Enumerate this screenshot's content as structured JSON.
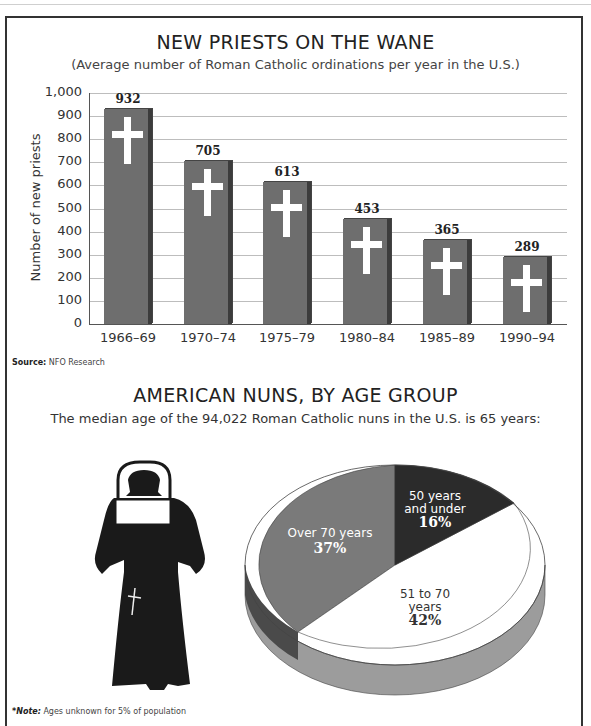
{
  "bar_chart": {
    "title": "NEW PRIESTS ON THE WANE",
    "subtitle": "(Average number of Roman Catholic ordinations per year in the U.S.)",
    "ylabel": "Number of new priests",
    "yticks": [
      "1,000",
      "900",
      "800",
      "700",
      "600",
      "500",
      "400",
      "300",
      "200",
      "100",
      "0"
    ],
    "categories": [
      "1966–69",
      "1970–74",
      "1975–79",
      "1980–84",
      "1985–89",
      "1990–94"
    ],
    "values": [
      "932",
      "705",
      "613",
      "453",
      "365",
      "289"
    ],
    "source_label": "Source:",
    "source_text": "NFO Research"
  },
  "pie_chart": {
    "title": "AMERICAN NUNS, BY AGE GROUP",
    "subtitle": "The median age of the 94,022 Roman Catholic nuns in the U.S. is 65 years:",
    "segments": [
      {
        "label_line1": "50 years",
        "label_line2": "and under",
        "pct": "16%"
      },
      {
        "label_line1": "51 to 70",
        "label_line2": "years",
        "pct": "42%"
      },
      {
        "label_line1": "Over 70 years",
        "label_line2": "",
        "pct": "37%"
      }
    ],
    "note_label": "*Note:",
    "note_text": "Ages unknown for 5% of population"
  },
  "colors": {
    "bar": "#6e6e6e",
    "bar_side": "#3c3c3c",
    "pie_dark": "#2b2b2b",
    "pie_white": "#ffffff",
    "pie_gray": "#7a7a7a",
    "nun": "#1a1a1a"
  },
  "chart_data": [
    {
      "type": "bar",
      "title": "NEW PRIESTS ON THE WANE",
      "subtitle": "(Average number of Roman Catholic ordinations per year in the U.S.)",
      "xlabel": "",
      "ylabel": "Number of new priests",
      "categories": [
        "1966–69",
        "1970–74",
        "1975–79",
        "1980–84",
        "1985–89",
        "1990–94"
      ],
      "values": [
        932,
        705,
        613,
        453,
        365,
        289
      ],
      "ylim": [
        0,
        1000
      ],
      "yticks": [
        0,
        100,
        200,
        300,
        400,
        500,
        600,
        700,
        800,
        900,
        1000
      ],
      "grid": true,
      "legend": "none",
      "annotations": [
        "Source: NFO Research"
      ]
    },
    {
      "type": "pie",
      "title": "AMERICAN NUNS, BY AGE GROUP",
      "subtitle": "The median age of the 94,022 Roman Catholic nuns in the U.S. is 65 years:",
      "categories": [
        "50 years and under",
        "51 to 70 years",
        "Over 70 years"
      ],
      "values": [
        16,
        42,
        37
      ],
      "annotations": [
        "*Note: Ages unknown for 5% of population"
      ],
      "legend": "labels on slices",
      "style": "3D"
    }
  ]
}
